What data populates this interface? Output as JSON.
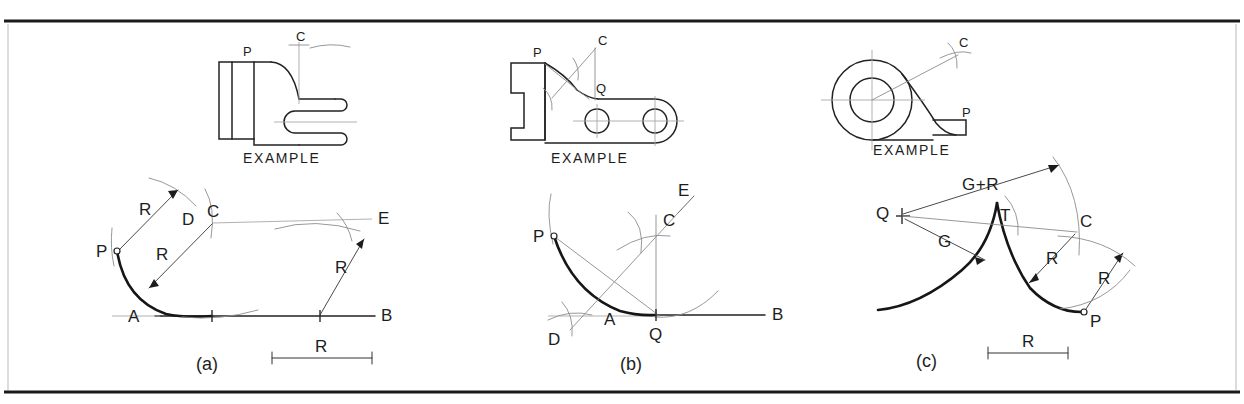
{
  "figure": {
    "background_color": "#ffffff",
    "ink_color": "#1d1d1d",
    "construction_color": "#8c8c8c",
    "width": 1244,
    "height": 404,
    "rules": {
      "top_rule_y": 21,
      "bottom_rule_y": 392,
      "frame_left_x": 8,
      "frame_right_x": 1236
    }
  },
  "panels": [
    {
      "id": "a",
      "caption": "(a)",
      "example_label": "EXAMPLE",
      "example_points": [
        "P",
        "C"
      ],
      "construction_labels": [
        "P",
        "C",
        "D",
        "E",
        "A",
        "B"
      ],
      "dimension_labels": [
        "R",
        "R",
        "R"
      ],
      "scale_bar_label": "R"
    },
    {
      "id": "b",
      "caption": "(b)",
      "example_label": "EXAMPLE",
      "example_points": [
        "P",
        "C",
        "Q"
      ],
      "construction_labels": [
        "P",
        "C",
        "D",
        "E",
        "A",
        "B",
        "Q"
      ],
      "dimension_labels": [],
      "scale_bar_label": ""
    },
    {
      "id": "c",
      "caption": "(c)",
      "example_label": "EXAMPLE",
      "example_points": [
        "C",
        "P"
      ],
      "construction_labels": [
        "Q",
        "T",
        "C",
        "P"
      ],
      "dimension_labels": [
        "G+R",
        "G",
        "R",
        "R"
      ],
      "scale_bar_label": "R"
    }
  ],
  "text": {
    "example": "EXAMPLE",
    "panel_a_caption": "(a)",
    "panel_b_caption": "(b)",
    "panel_c_caption": "(c)",
    "label_P": "P",
    "label_Q": "Q",
    "label_C": "C",
    "label_D": "D",
    "label_E": "E",
    "label_A": "A",
    "label_B": "B",
    "label_T": "T",
    "label_R": "R",
    "label_G": "G",
    "label_GplusR": "G+R"
  }
}
